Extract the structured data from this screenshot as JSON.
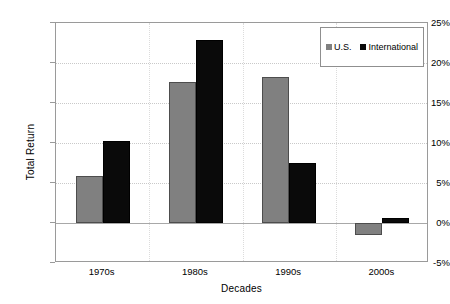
{
  "chart_data": {
    "type": "bar",
    "title": "",
    "xlabel": "Decades",
    "ylabel": "Total Return",
    "categories": [
      "1970s",
      "1980s",
      "1990s",
      "2000s"
    ],
    "series": [
      {
        "name": "U.S.",
        "color": "#808080",
        "values": [
          5.9,
          17.6,
          18.3,
          -1.5
        ]
      },
      {
        "name": "International",
        "color": "#000000",
        "values": [
          10.2,
          22.9,
          7.5,
          0.6
        ]
      }
    ],
    "ylim": [
      -5,
      25
    ],
    "ytick_values": [
      -5,
      0,
      5,
      10,
      15,
      20,
      25
    ],
    "ytick_labels": [
      "-5%",
      "0%",
      "5%",
      "10%",
      "15%",
      "20%",
      "25%"
    ],
    "grid": true,
    "legend_position": "top-right",
    "value_suffix": "%"
  },
  "legend": {
    "entries": [
      {
        "label": "U.S.",
        "swatch": "gray-square-icon"
      },
      {
        "label": "International",
        "swatch": "black-square-icon"
      }
    ]
  }
}
